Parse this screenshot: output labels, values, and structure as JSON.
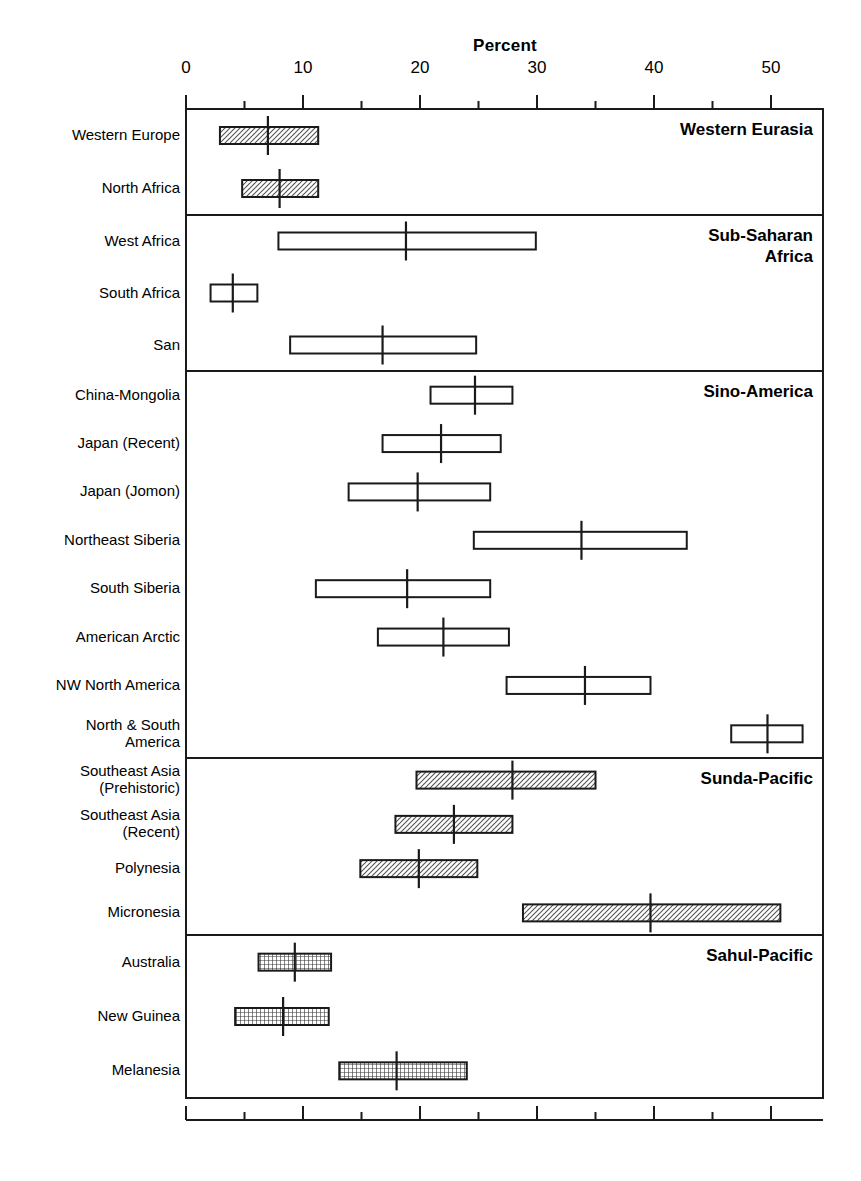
{
  "chart_data": {
    "type": "bar",
    "title": "Percent",
    "xlabel": "Percent",
    "ylabel": "",
    "xlim": [
      0,
      54.5
    ],
    "grid": false,
    "legend": null,
    "axis": {
      "major_ticks": [
        0,
        10,
        20,
        30,
        40,
        50
      ],
      "minor_ticks": [
        5,
        15,
        25,
        35,
        45
      ],
      "tick_labels": [
        "0",
        "10",
        "20",
        "30",
        "40",
        "50"
      ]
    },
    "note": "Horizontal range boxes with a vertical mean marker; grouped into five regional panels.",
    "groups": [
      {
        "name": "Western Eurasia",
        "fill": "hatch-diagonal",
        "rows": [
          {
            "label": "Western Europe",
            "low": 2.9,
            "high": 11.3,
            "mean": 7.0
          },
          {
            "label": "North Africa",
            "low": 4.8,
            "high": 11.3,
            "mean": 8.0
          }
        ]
      },
      {
        "name": "Sub-Saharan\nAfrica",
        "fill": "none",
        "rows": [
          {
            "label": "West Africa",
            "low": 7.9,
            "high": 29.9,
            "mean": 18.8
          },
          {
            "label": "South Africa",
            "low": 2.1,
            "high": 6.1,
            "mean": 4.0
          },
          {
            "label": "San",
            "low": 8.9,
            "high": 24.8,
            "mean": 16.8
          }
        ]
      },
      {
        "name": "Sino-America",
        "fill": "none",
        "rows": [
          {
            "label": "China-Mongolia",
            "low": 20.9,
            "high": 27.9,
            "mean": 24.7
          },
          {
            "label": "Japan (Recent)",
            "low": 16.8,
            "high": 26.9,
            "mean": 21.8
          },
          {
            "label": "Japan (Jomon)",
            "low": 13.9,
            "high": 26.0,
            "mean": 19.8
          },
          {
            "label": "Northeast Siberia",
            "low": 24.6,
            "high": 42.8,
            "mean": 33.8
          },
          {
            "label": "South Siberia",
            "low": 11.1,
            "high": 26.0,
            "mean": 18.9
          },
          {
            "label": "American Arctic",
            "low": 16.4,
            "high": 27.6,
            "mean": 22.0
          },
          {
            "label": "NW North America",
            "low": 27.4,
            "high": 39.7,
            "mean": 34.1
          },
          {
            "label": "North & South\nAmerica",
            "low": 46.6,
            "high": 52.7,
            "mean": 49.7
          }
        ]
      },
      {
        "name": "Sunda-Pacific",
        "fill": "hatch-diagonal",
        "rows": [
          {
            "label": "Southeast Asia\n(Prehistoric)",
            "low": 19.7,
            "high": 35.0,
            "mean": 27.9
          },
          {
            "label": "Southeast Asia\n(Recent)",
            "low": 17.9,
            "high": 27.9,
            "mean": 22.9
          },
          {
            "label": "Polynesia",
            "low": 14.9,
            "high": 24.9,
            "mean": 19.9
          },
          {
            "label": "Micronesia",
            "low": 28.8,
            "high": 50.8,
            "mean": 39.7
          }
        ]
      },
      {
        "name": "Sahul-Pacific",
        "fill": "grid-cross",
        "rows": [
          {
            "label": "Australia",
            "low": 6.2,
            "high": 12.4,
            "mean": 9.3
          },
          {
            "label": "New Guinea",
            "low": 4.2,
            "high": 12.2,
            "mean": 8.3
          },
          {
            "label": "Melanesia",
            "low": 13.1,
            "high": 24.0,
            "mean": 18.0
          }
        ]
      }
    ]
  },
  "colors": {
    "stroke": "#1a1a1a",
    "background": "#ffffff",
    "hatch": "#4d4d4d"
  }
}
